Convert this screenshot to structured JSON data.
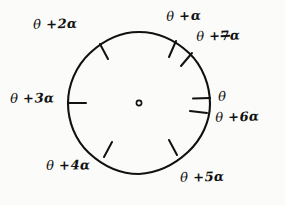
{
  "figure": {
    "kind": "hand-drawn-circle-angle-diagram",
    "background_color": "#fbfbf9",
    "ink_color": "#111111",
    "circle": {
      "center_x": 139,
      "center_y": 103,
      "radius": 71,
      "stroke_width": 2
    },
    "center_mark": {
      "name": "center-dot",
      "radius": 3,
      "filled": false
    },
    "symbols": {
      "theta": "θ",
      "alpha": "α",
      "plus": "+"
    },
    "ticks": [
      {
        "name": "tick-theta",
        "angle_deg": 3,
        "inner_offset": 14
      },
      {
        "name": "tick-theta-plus-1a",
        "angle_deg": 57,
        "inner_offset": 14
      },
      {
        "name": "tick-theta-plus-2a",
        "angle_deg": 117,
        "inner_offset": 14
      },
      {
        "name": "tick-theta-plus-3a",
        "angle_deg": 180,
        "inner_offset": 14
      },
      {
        "name": "tick-theta-plus-4a",
        "angle_deg": 231,
        "inner_offset": 14
      },
      {
        "name": "tick-theta-plus-5a",
        "angle_deg": 293,
        "inner_offset": 14
      },
      {
        "name": "tick-theta-plus-6a",
        "angle_deg": 342,
        "inner_offset": 14
      },
      {
        "name": "tick-theta-plus-7a",
        "angle_deg": 42,
        "inner_offset": 14
      }
    ],
    "labels": [
      {
        "id": "0",
        "text": "θ",
        "theta": "θ",
        "op": "",
        "coef": "",
        "alpha": ""
      },
      {
        "id": "1a",
        "text": "θ +α",
        "theta": "θ",
        "op": "+",
        "coef": "",
        "alpha": "α"
      },
      {
        "id": "2a",
        "text": "θ + 2α",
        "theta": "θ",
        "op": "+",
        "coef": "2",
        "alpha": "α"
      },
      {
        "id": "3a",
        "text": "θ + 3α",
        "theta": "θ",
        "op": "+",
        "coef": "3",
        "alpha": "α"
      },
      {
        "id": "4a",
        "text": "θ + 4α",
        "theta": "θ",
        "op": "+",
        "coef": "4",
        "alpha": "α"
      },
      {
        "id": "5a",
        "text": "θ + 5α",
        "theta": "θ",
        "op": "+",
        "coef": "5",
        "alpha": "α"
      },
      {
        "id": "6a",
        "text": "θ + 6α",
        "theta": "θ",
        "op": "+",
        "coef": "6",
        "alpha": "α"
      },
      {
        "id": "7a",
        "text": "θ + 7α",
        "theta": "θ",
        "op": "+",
        "coef": "7",
        "alpha": "α"
      }
    ]
  }
}
